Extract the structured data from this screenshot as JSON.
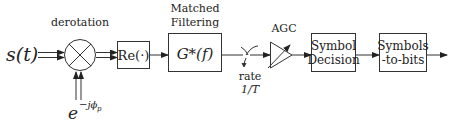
{
  "diagram": {
    "type": "block-diagram",
    "input_signal": {
      "label": "s(t)"
    },
    "mixer": {
      "label": "derotation",
      "symbol": "multiply-cross"
    },
    "phase_input": {
      "base": "e",
      "exponent": "−jϕ",
      "subscript": "p"
    },
    "blocks": [
      {
        "id": "real-part",
        "lines": [
          "Re(·)"
        ]
      },
      {
        "id": "matched-filter",
        "title_lines": [
          "Matched",
          "Filtering"
        ],
        "lines": [
          "G*(f)"
        ]
      },
      {
        "id": "sampler",
        "label_lines": [
          "rate",
          "1/T"
        ]
      },
      {
        "id": "agc",
        "title": "AGC",
        "shape": "amplifier-triangle"
      },
      {
        "id": "symbol-decision",
        "lines": [
          "Symbol",
          "Decision"
        ]
      },
      {
        "id": "symbols-to-bits",
        "lines": [
          "Symbols",
          "-to-bits"
        ]
      }
    ],
    "colors": {
      "stroke": "#333333",
      "text": "#222222",
      "background": "#ffffff"
    }
  }
}
